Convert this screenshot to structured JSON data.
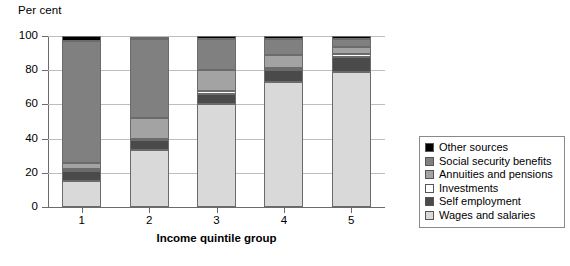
{
  "axis": {
    "y_caption": "Per cent",
    "x_title": "Income quintile group",
    "y_ticks": [
      "0",
      "20",
      "40",
      "60",
      "80",
      "100"
    ],
    "x_ticks": [
      "1",
      "2",
      "3",
      "4",
      "5"
    ]
  },
  "legend": {
    "items": [
      {
        "label": "Other sources",
        "color": "#000000"
      },
      {
        "label": "Social security benefits",
        "color": "#808080"
      },
      {
        "label": "Annuities and pensions",
        "color": "#a3a3a3"
      },
      {
        "label": "Investments",
        "color": "#ffffff"
      },
      {
        "label": "Self employment",
        "color": "#4a4a4a"
      },
      {
        "label": "Wages and salaries",
        "color": "#d9d9d9"
      }
    ]
  },
  "chart_data": {
    "type": "bar",
    "stacked": true,
    "title": "",
    "xlabel": "Income quintile group",
    "ylabel": "Per cent",
    "ylim": [
      0,
      100
    ],
    "yticks": [
      0,
      20,
      40,
      60,
      80,
      100
    ],
    "grid": true,
    "legend_position": "right",
    "categories": [
      "1",
      "2",
      "3",
      "4",
      "5"
    ],
    "series": [
      {
        "name": "Wages and salaries",
        "color": "#d9d9d9",
        "values": [
          15.0,
          33.5,
          60.0,
          73.0,
          79.0
        ]
      },
      {
        "name": "Self employment",
        "color": "#4a4a4a",
        "values": [
          6.0,
          5.5,
          6.0,
          7.0,
          9.0
        ]
      },
      {
        "name": "Investments",
        "color": "#ffffff",
        "values": [
          1.5,
          1.0,
          2.0,
          1.5,
          1.5
        ]
      },
      {
        "name": "Annuities and pensions",
        "color": "#a3a3a3",
        "values": [
          3.0,
          12.0,
          12.0,
          7.5,
          4.0
        ]
      },
      {
        "name": "Social security benefits",
        "color": "#808080",
        "values": [
          71.5,
          46.0,
          18.0,
          9.0,
          4.5
        ]
      },
      {
        "name": "Other sources",
        "color": "#000000",
        "values": [
          3.0,
          1.5,
          2.0,
          2.0,
          2.0
        ]
      }
    ]
  }
}
